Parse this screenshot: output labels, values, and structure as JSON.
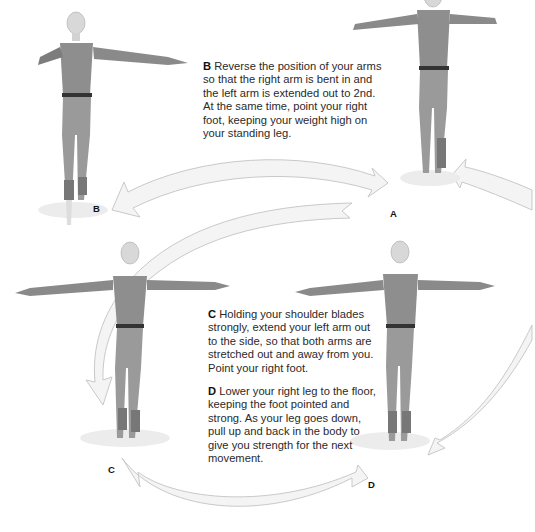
{
  "steps": [
    {
      "letter": "B",
      "text": "Reverse the position of your arms so that the right arm is bent in and the left arm is extended out to 2nd. At the same time, point your right foot, keeping your weight high on your standing leg."
    },
    {
      "letter": "C",
      "text": "Holding your shoulder blades strongly, extend your left arm out to the side, so that both arms are stretched out and away from you. Point your right foot."
    },
    {
      "letter": "D",
      "text": "Lower your right leg to the floor, keeping the foot pointed and strong. As your leg goes down, pull up and back in the body to give you strength for the next movement."
    }
  ],
  "figure_labels": {
    "a": "A",
    "b": "B",
    "c": "C",
    "d": "D"
  },
  "figures": [
    {
      "id": "figure-b",
      "pose": "right arm bent in, left arm extended to 2nd, right foot pointed"
    },
    {
      "id": "figure-a",
      "pose": "both arms bent, starting position"
    },
    {
      "id": "figure-c",
      "pose": "both arms stretched out to the side"
    },
    {
      "id": "figure-d",
      "pose": "arms out, right leg lowered"
    }
  ],
  "colors": {
    "arrow_fill": "#f4f4f4",
    "arrow_stroke": "#c9c9c9",
    "leotard": "#8a8a8a",
    "skin": "#d9d9d9",
    "belt": "#333333",
    "text": "#2a2a2a"
  }
}
